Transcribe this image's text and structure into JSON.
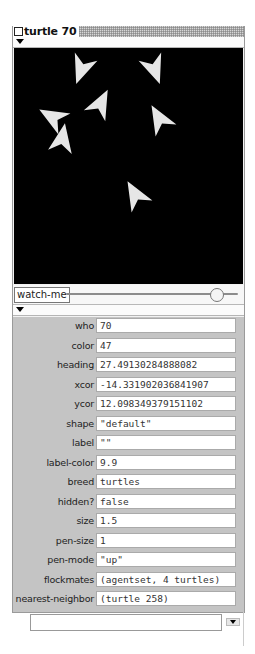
{
  "window": {
    "title": "turtle 70",
    "icon": "close-box-icon"
  },
  "view": {
    "background": "#000000",
    "turtle_color": "#e6e6e6",
    "turtles": [
      {
        "x": 68,
        "y": 20,
        "heading": 200
      },
      {
        "x": 140,
        "y": 20,
        "heading": 160
      },
      {
        "x": 86,
        "y": 57,
        "heading": 27
      },
      {
        "x": 40,
        "y": 70,
        "heading": 300
      },
      {
        "x": 48,
        "y": 92,
        "heading": 10
      },
      {
        "x": 146,
        "y": 72,
        "heading": 330
      },
      {
        "x": 122,
        "y": 148,
        "heading": 330
      }
    ]
  },
  "watch": {
    "button_label": "watch-me",
    "slider_position": 0.88
  },
  "properties": [
    {
      "label": "who",
      "value": "70"
    },
    {
      "label": "color",
      "value": "47"
    },
    {
      "label": "heading",
      "value": "27.49130284888082"
    },
    {
      "label": "xcor",
      "value": "-14.331902036841907"
    },
    {
      "label": "ycor",
      "value": "12.098349379151102"
    },
    {
      "label": "shape",
      "value": "\"default\""
    },
    {
      "label": "label",
      "value": "\"\""
    },
    {
      "label": "label-color",
      "value": "9.9"
    },
    {
      "label": "breed",
      "value": "turtles"
    },
    {
      "label": "hidden?",
      "value": "false"
    },
    {
      "label": "size",
      "value": "1.5"
    },
    {
      "label": "pen-size",
      "value": "1"
    },
    {
      "label": "pen-mode",
      "value": "\"up\""
    },
    {
      "label": "flockmates",
      "value": "(agentset, 4 turtles)"
    },
    {
      "label": "nearest-neighbor",
      "value": "(turtle 258)"
    }
  ],
  "command": {
    "value": "",
    "dropdown_icon": "chevron-down-icon"
  }
}
